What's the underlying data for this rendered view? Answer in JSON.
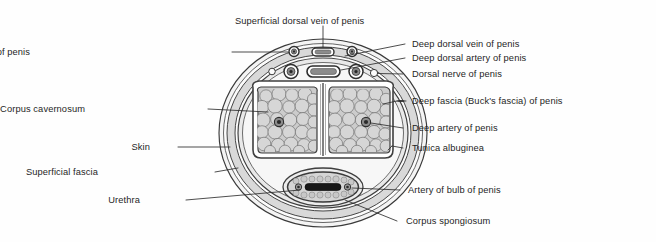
{
  "figure": {
    "type": "anatomical-cross-section",
    "background_color": "#fefefe",
    "line_color": "#3a3a3a",
    "text_color": "#1f1f1f"
  },
  "labels": {
    "superficial_dorsal_vein": "Superficial dorsal vein of penis",
    "superficial_dorsal_artery": "Superficial dorsal artery of penis",
    "deep_dorsal_vein": "Deep dorsal vein of penis",
    "deep_dorsal_artery": "Deep dorsal artery of penis",
    "dorsal_nerve": "Dorsal nerve of penis",
    "deep_fascia": "Deep fascia (Buck's fascia) of penis",
    "corpus_cavernosum": "Corpus cavernosum",
    "deep_artery": "Deep artery of penis",
    "skin": "Skin",
    "tunica_albuginea": "Tunica albuginea",
    "superficial_fascia": "Superficial fascia",
    "artery_of_bulb": "Artery of bulb of penis",
    "urethra": "Urethra",
    "corpus_spongiosum": "Corpus spongiosum"
  },
  "structures": {
    "layers": [
      {
        "name": "skin",
        "fill": "#f2f2f2"
      },
      {
        "name": "superficial-fascia",
        "fill": "#d8d8d8"
      },
      {
        "name": "deep-fascia-bucks",
        "fill": "#efefef"
      },
      {
        "name": "tunica-albuginea",
        "fill": "#ffffff"
      },
      {
        "name": "cavernous-tissue",
        "fill": "#cfcfcf"
      },
      {
        "name": "spongy-tissue",
        "fill": "#dcdcdc"
      }
    ],
    "vessels": [
      {
        "name": "superficial-dorsal-vein",
        "shape": "oval"
      },
      {
        "name": "superficial-dorsal-artery-left",
        "shape": "circle"
      },
      {
        "name": "superficial-dorsal-artery-right",
        "shape": "circle"
      },
      {
        "name": "deep-dorsal-vein",
        "shape": "oval"
      },
      {
        "name": "deep-dorsal-artery-left",
        "shape": "circle"
      },
      {
        "name": "deep-dorsal-artery-right",
        "shape": "circle"
      },
      {
        "name": "dorsal-nerve-left",
        "shape": "small-circle"
      },
      {
        "name": "dorsal-nerve-right",
        "shape": "small-circle"
      },
      {
        "name": "deep-artery-left",
        "shape": "circle"
      },
      {
        "name": "deep-artery-right",
        "shape": "circle"
      },
      {
        "name": "artery-of-bulb-left",
        "shape": "small-circle"
      },
      {
        "name": "artery-of-bulb-right",
        "shape": "small-circle"
      },
      {
        "name": "urethral-lumen",
        "shape": "slit"
      }
    ]
  }
}
